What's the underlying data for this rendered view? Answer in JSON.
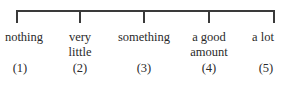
{
  "scale": {
    "points": [
      {
        "label": "nothing",
        "label_line2": "",
        "number": "(1)",
        "x": 16
      },
      {
        "label": "very",
        "label_line2": "little",
        "number": "(2)",
        "x": 80
      },
      {
        "label": "something",
        "label_line2": "",
        "number": "(3)",
        "x": 144
      },
      {
        "label": "a good",
        "label_line2": "amount",
        "number": "(4)",
        "x": 209
      },
      {
        "label": "a lot",
        "label_line2": "",
        "number": "(5)",
        "x": 274
      }
    ]
  }
}
